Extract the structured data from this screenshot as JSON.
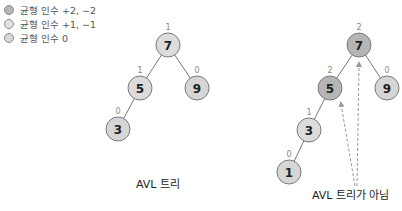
{
  "legend": {
    "items": [
      {
        "label": "균형 인수 +2, −2",
        "color": "#b5b5b5"
      },
      {
        "label": "균형 인수 +1, −1",
        "color": "#dcdcdc"
      },
      {
        "label": "균형 인수 0",
        "color": "#d6d6d6"
      }
    ]
  },
  "colors": {
    "unbalanced": "#b5b5b5",
    "balanced_pm1": "#dcdcdc",
    "balanced_0": "#d6d6d6",
    "stroke": "#7a7a7a",
    "edge": "#777777",
    "arrow": "#999999"
  },
  "trees": [
    {
      "caption": "AVL 트리",
      "nodes": [
        {
          "value": "7",
          "balance": "1"
        },
        {
          "value": "5",
          "balance": "1"
        },
        {
          "value": "9",
          "balance": "0"
        },
        {
          "value": "3",
          "balance": "0"
        }
      ]
    },
    {
      "caption": "AVL 트리가 아님",
      "nodes": [
        {
          "value": "7",
          "balance": "2"
        },
        {
          "value": "5",
          "balance": "2"
        },
        {
          "value": "9",
          "balance": "0"
        },
        {
          "value": "3",
          "balance": "1"
        },
        {
          "value": "1",
          "balance": "0"
        }
      ]
    }
  ]
}
